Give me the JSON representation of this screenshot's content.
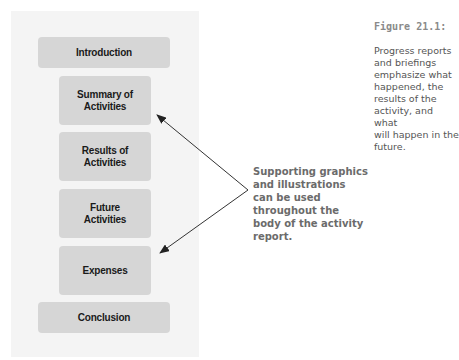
{
  "diagram": {
    "sections": [
      {
        "label": "Introduction",
        "width": "wide",
        "top": 37
      },
      {
        "label": "Summary of\nActivities",
        "width": "narrow",
        "top": 76
      },
      {
        "label": "Results of\nActivities",
        "width": "narrow",
        "top": 132
      },
      {
        "label": "Future\nActivities",
        "width": "narrow",
        "top": 189
      },
      {
        "label": "Expenses",
        "width": "narrow",
        "top": 246
      },
      {
        "label": "Conclusion",
        "width": "wide",
        "top": 302
      }
    ],
    "callout": "Supporting graphics\nand illustrations\ncan be used\nthroughout the\nbody of the activity\nreport.",
    "arrows": [
      {
        "from": [
          248,
          190
        ],
        "to": [
          157,
          115
        ]
      },
      {
        "from": [
          248,
          190
        ],
        "to": [
          160,
          253
        ]
      }
    ],
    "colors": {
      "panel": "#f4f4f4",
      "box": "#d6d6d6",
      "box_text": "#1a1a1a",
      "callout_text": "#6b6b6b",
      "arrow": "#333333"
    }
  },
  "caption": {
    "figure_label": "Figure 21.1:",
    "text": "Progress reports\nand briefings\nemphasize what\nhappened, the\nresults of the\nactivity, and what\nwill happen in the\nfuture."
  }
}
